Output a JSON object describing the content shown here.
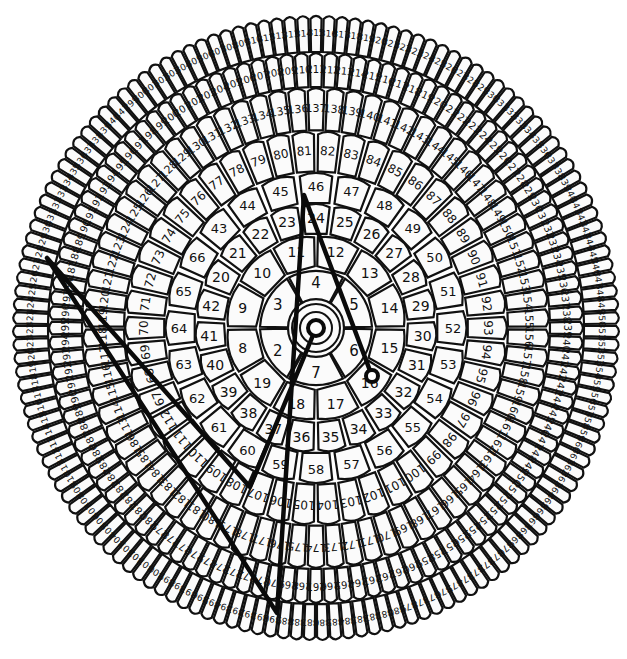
{
  "diagram": {
    "title_cut_off": "",
    "center": {
      "x": 316,
      "y": 328
    },
    "scale": {
      "sx": 1.0,
      "sy": 1.03
    },
    "hub": {
      "label": "1",
      "inner_r": 8,
      "ring_r": 16,
      "outer_r": 24
    },
    "rings": [
      {
        "name": "ring-1",
        "start": 2,
        "count": 6,
        "r_in": 28,
        "r_out": 60,
        "anchor_num": 4,
        "anchor_deg": -90,
        "font": 15
      },
      {
        "name": "ring-2",
        "start": 8,
        "count": 12,
        "r_in": 60,
        "r_out": 92,
        "anchor_num": 11.5,
        "anchor_deg": -90,
        "font": 14
      },
      {
        "name": "ring-3",
        "start": 20,
        "count": 23,
        "r_in": 92,
        "r_out": 122,
        "anchor_num": 24,
        "anchor_deg": -90,
        "font": 14
      },
      {
        "name": "ring-4",
        "start": 43,
        "count": 24,
        "r_in": 122,
        "r_out": 152,
        "anchor_num": 46,
        "anchor_deg": -90,
        "font": 13
      },
      {
        "name": "ring-5",
        "start": 67,
        "count": 46,
        "r_in": 152,
        "r_out": 192,
        "anchor_num": 81.5,
        "anchor_deg": -90,
        "font": 12
      },
      {
        "name": "ring-6",
        "start": 113,
        "count": 74,
        "r_in": 192,
        "r_out": 234,
        "anchor_num": 137,
        "anchor_deg": -90,
        "font": 11
      },
      {
        "name": "ring-7",
        "start": 187,
        "count": 112,
        "r_in": 234,
        "r_out": 268,
        "anchor_num": 211,
        "anchor_deg": -90,
        "font": 10
      },
      {
        "name": "ring-8",
        "start": 299,
        "count": 143,
        "r_in": 268,
        "r_out": 304,
        "anchor_num": 315,
        "anchor_deg": -90,
        "font": 9
      }
    ],
    "path": {
      "points": [
        {
          "x": 316,
          "y": 328,
          "cell": "1"
        },
        {
          "x": 250,
          "y": 487,
          "cell": "112"
        },
        {
          "x": 47,
          "y": 258,
          "cell": "429"
        },
        {
          "x": 277,
          "y": 613,
          "cell": "391"
        },
        {
          "x": 304,
          "y": 195,
          "cell": "46"
        },
        {
          "x": 372,
          "y": 376,
          "cell": "16"
        }
      ],
      "end_marker": {
        "x": 372,
        "y": 376,
        "r": 6
      },
      "start_marker": {
        "x": 316,
        "y": 328,
        "r": 8
      }
    },
    "colors": {
      "line": "#0a0a0a",
      "cell_fill": "#fbfbfb",
      "cell_stroke": "#111111",
      "background": "#ffffff"
    }
  }
}
